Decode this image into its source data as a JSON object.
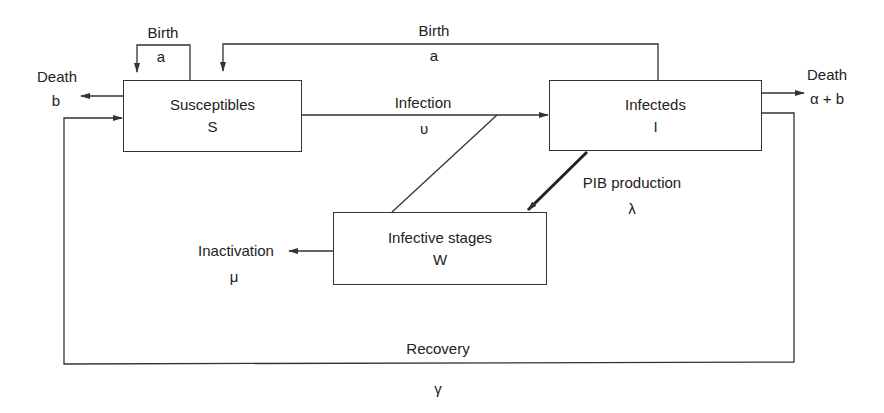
{
  "compartments": {
    "susceptibles": {
      "name": "Susceptibles",
      "symbol": "S"
    },
    "infecteds": {
      "name": "Infecteds",
      "symbol": "I"
    },
    "infective_stages": {
      "name": "Infective stages",
      "symbol": "W"
    }
  },
  "flows": {
    "birth_s": {
      "label": "Birth",
      "param": "a"
    },
    "birth_i": {
      "label": "Birth",
      "param": "a"
    },
    "death_s": {
      "label": "Death",
      "param": "b"
    },
    "death_i": {
      "label": "Death",
      "param": "α + b"
    },
    "infection": {
      "label": "Infection",
      "param": "υ"
    },
    "pib_production": {
      "label": "PIB production",
      "param": "λ"
    },
    "inactivation": {
      "label": "Inactivation",
      "param": "μ"
    },
    "recovery": {
      "label": "Recovery",
      "param": "γ"
    }
  },
  "colors": {
    "line": "#333333",
    "background": "#ffffff"
  }
}
